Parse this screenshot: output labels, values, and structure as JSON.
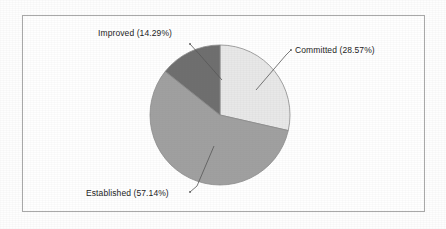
{
  "figure": {
    "background_color": "#fefefe",
    "frame_color": "#a9a9a9",
    "plot_background": "#ffffff"
  },
  "labels": {
    "improved": "Improved (14.29%)",
    "committed": "Committed (28.57%)",
    "established": "Established (57.14%)"
  },
  "chart_data": {
    "type": "pie",
    "title": "",
    "subtitle": "",
    "xlabel": "",
    "ylabel": "",
    "grid": false,
    "legend_position": "none",
    "label_style": "outside-with-leader-lines",
    "start_angle_deg": 90,
    "direction": "clockwise",
    "center": {
      "x": 220,
      "y": 115
    },
    "radius": 70,
    "categories": [
      "Committed",
      "Established",
      "Improved"
    ],
    "values": [
      28.57,
      57.14,
      14.29
    ],
    "value_unit": "percent",
    "slices": [
      {
        "name": "Committed",
        "label": "Committed (28.57%)",
        "value": 28.57,
        "color": "#e8e8e8",
        "start_angle_deg": 0,
        "end_angle_deg": 102.85
      },
      {
        "name": "Established",
        "label": "Established (57.14%)",
        "value": 57.14,
        "color": "#a0a0a0",
        "start_angle_deg": 102.85,
        "end_angle_deg": 308.56
      },
      {
        "name": "Improved",
        "label": "Improved (14.29%)",
        "value": 14.29,
        "color": "#6e6e6e",
        "start_angle_deg": 308.56,
        "end_angle_deg": 360
      }
    ],
    "total": 100.0
  }
}
